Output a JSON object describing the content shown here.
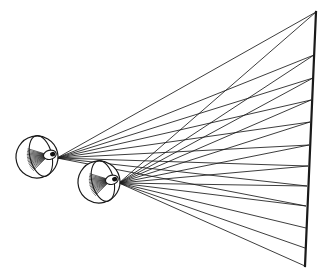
{
  "figure": {
    "domain": "Diagram",
    "caption": "",
    "width": 331,
    "height": 279,
    "background_color": "#ffffff",
    "line_color": "#1a1a1a"
  },
  "screen": {
    "name": "projection-plane",
    "label": "",
    "x_top": 316,
    "y_top": 12,
    "x_bottom": 305,
    "y_bottom": 266,
    "stroke_width": 2.2
  },
  "eyes": [
    {
      "id": "left-eye",
      "label": "",
      "globe_center_x": 37,
      "globe_center_y": 157,
      "globe_radius": 21,
      "tilt_deg": -14,
      "nodal_point_x": 57,
      "nodal_point_y": 158,
      "lens_cx": 50,
      "lens_cy": 158,
      "lens_rx": 6.5,
      "lens_ry": 4.6,
      "pupil_rx": 2.6,
      "pupil_ry": 2.3,
      "internal_fan_count": 17,
      "internal_fan_spread_deg": 62,
      "internal_fan_length": 21
    },
    {
      "id": "right-eye",
      "label": "",
      "globe_center_x": 99,
      "globe_center_y": 182,
      "globe_radius": 21,
      "tilt_deg": -14,
      "nodal_point_x": 119,
      "nodal_point_y": 183,
      "lens_cx": 112,
      "lens_cy": 183,
      "lens_rx": 6.5,
      "lens_ry": 4.6,
      "pupil_rx": 2.6,
      "pupil_ry": 2.3,
      "internal_fan_count": 17,
      "internal_fan_spread_deg": 62,
      "internal_fan_length": 21
    }
  ],
  "chart_data": {
    "type": "scatter",
    "xlabel": "",
    "ylabel": "",
    "xlim": [
      0,
      331
    ],
    "ylim": [
      279,
      0
    ],
    "grid": false,
    "legend": "none",
    "screen_endpoints": {
      "top": [
        316,
        12
      ],
      "bottom": [
        305,
        266
      ]
    },
    "series": [
      {
        "name": "left-eye-rays",
        "origin": [
          57,
          158
        ],
        "stroke_width": 0.85,
        "targets": [
          [
            316,
            12
          ],
          [
            314,
            55
          ],
          [
            313,
            78
          ],
          [
            311,
            100
          ],
          [
            310,
            122
          ],
          [
            309,
            145
          ],
          [
            308,
            166
          ],
          [
            307,
            186
          ],
          [
            306,
            206
          ]
        ]
      },
      {
        "name": "right-eye-rays",
        "origin": [
          119,
          183
        ],
        "stroke_width": 0.85,
        "targets": [
          [
            316,
            12
          ],
          [
            314,
            55
          ],
          [
            313,
            78
          ],
          [
            311,
            100
          ],
          [
            310,
            122
          ],
          [
            309,
            145
          ],
          [
            308,
            166
          ],
          [
            307,
            186
          ],
          [
            306,
            206
          ],
          [
            306,
            228
          ],
          [
            305,
            248
          ],
          [
            305,
            266
          ]
        ]
      }
    ],
    "notes": [
      "Both fans originate at the nodal point just behind each lens.",
      "Fans cross in the mid-field producing a lattice of intersections.",
      "The right eye is displaced down-right relative to the left eye."
    ]
  }
}
